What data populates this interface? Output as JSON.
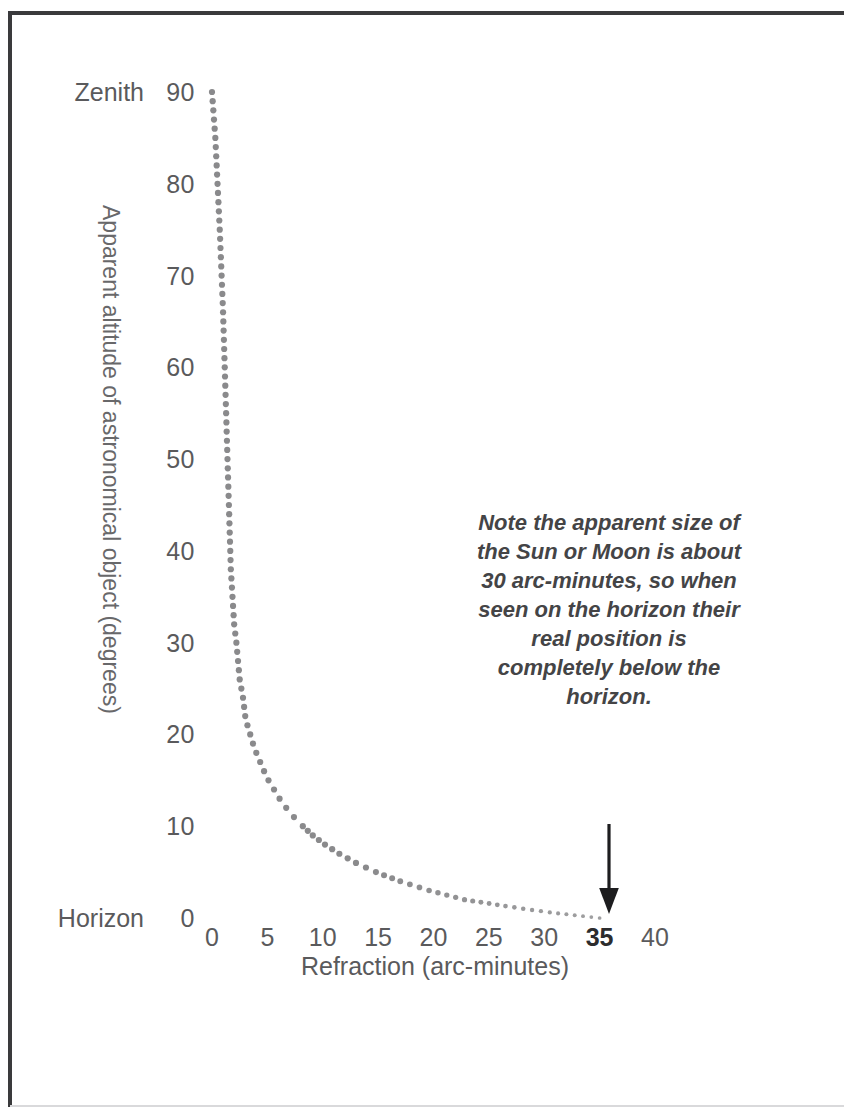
{
  "figure": {
    "frame_color": "#3a3a3c",
    "background": "#ffffff"
  },
  "annotation": {
    "note_text": "Note the apparent size of the Sun or Moon is about 30 arc-minutes, so when seen on the horizon their real position is completely below the horizon.",
    "arrow_name": "down-arrow-icon",
    "arrow_points_to": "35"
  },
  "chart_data": {
    "type": "scatter",
    "title": "",
    "subtitle": "",
    "xlabel": "Refraction (arc-minutes)",
    "ylabel": "Apparent altitude of astronomical object (degrees)",
    "xlim": [
      0,
      40
    ],
    "ylim": [
      0,
      90
    ],
    "grid": false,
    "legend": null,
    "marker_color": "#8a8a8c",
    "marker_style": "dotted-circle",
    "x_ticks": [
      "0",
      "5",
      "10",
      "15",
      "20",
      "25",
      "30",
      "35",
      "40"
    ],
    "x_tick_values": [
      0,
      5,
      10,
      15,
      20,
      25,
      30,
      35,
      40
    ],
    "x_tick_emphasis": "35",
    "y_ticks": [
      "0",
      "10",
      "20",
      "30",
      "40",
      "50",
      "60",
      "70",
      "80",
      "90"
    ],
    "y_tick_values": [
      0,
      10,
      20,
      30,
      40,
      50,
      60,
      70,
      80,
      90
    ],
    "y_axis_end_labels": [
      {
        "text": "Zenith",
        "value": 90
      },
      {
        "text": "Horizon",
        "value": 0
      }
    ],
    "series": [
      {
        "name": "Atmospheric refraction",
        "x": [
          0.0,
          0.3,
          0.5,
          0.7,
          0.8,
          0.9,
          1.0,
          1.05,
          1.1,
          1.15,
          1.2,
          1.25,
          1.3,
          1.35,
          1.4,
          1.45,
          1.5,
          1.55,
          1.6,
          1.65,
          1.7,
          1.8,
          1.9,
          2.0,
          2.1,
          2.2,
          2.35,
          2.5,
          2.65,
          2.8,
          3.0,
          3.2,
          3.45,
          3.7,
          4.0,
          4.35,
          4.7,
          5.1,
          5.6,
          6.1,
          6.7,
          7.4,
          8.2,
          9.1,
          10.2,
          11.5,
          13.0,
          14.8,
          17.0,
          19.6,
          22.8,
          26.5,
          30.5,
          35.0
        ],
        "y": [
          90,
          85,
          80,
          75,
          72,
          69,
          66,
          64,
          62,
          60,
          58,
          56,
          54,
          52,
          50,
          48,
          46,
          44,
          42,
          40,
          38,
          36,
          34,
          32,
          31,
          30,
          28,
          26,
          25,
          24,
          22,
          21,
          20,
          19,
          18,
          17,
          16,
          15,
          14,
          13,
          12,
          11,
          10,
          9,
          8,
          7,
          6,
          5,
          4,
          3,
          2,
          1.3,
          0.6,
          0
        ]
      }
    ],
    "axis_geometry": {
      "x_px_at_0": 212,
      "x_px_at_40": 655,
      "y_px_at_0": 918,
      "y_px_at_90": 92
    }
  }
}
